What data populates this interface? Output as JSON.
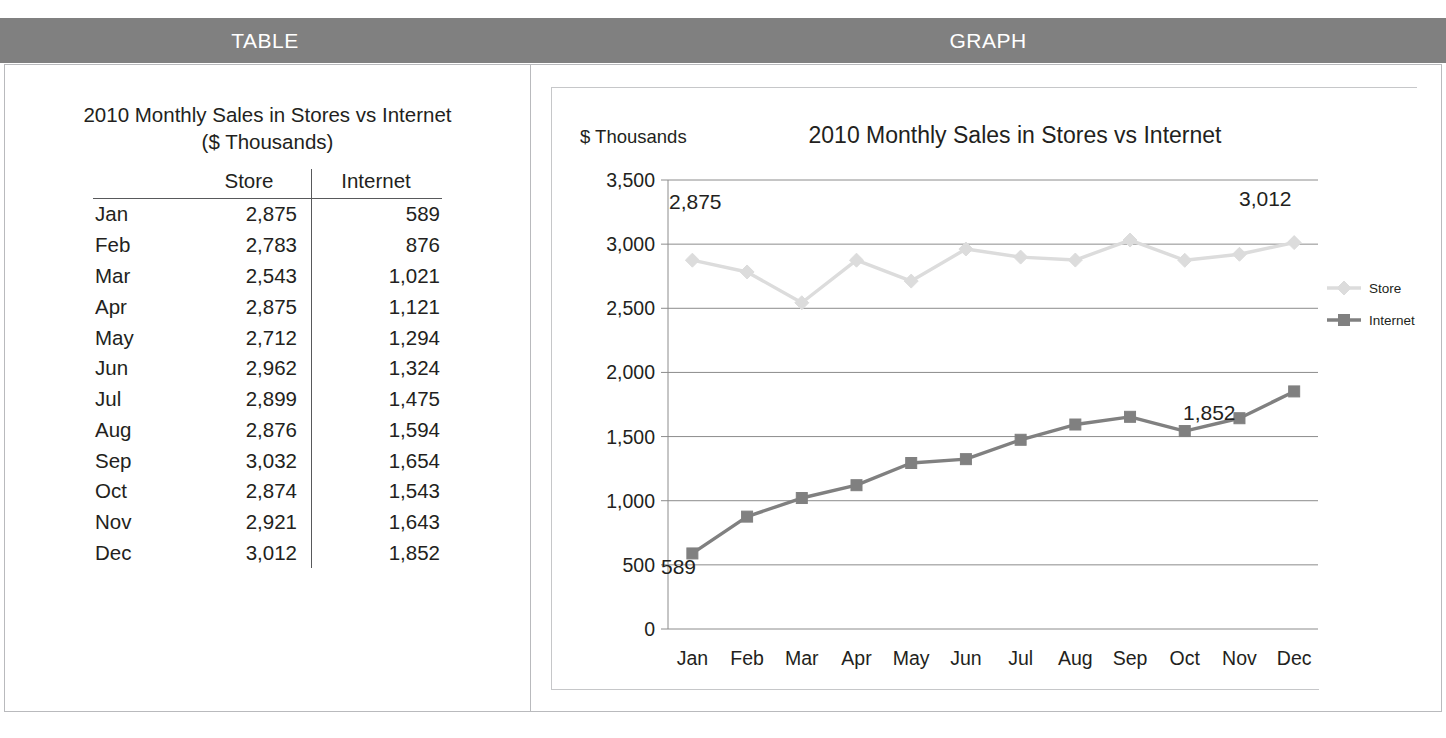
{
  "header": {
    "table_label": "TABLE",
    "graph_label": "GRAPH",
    "band_color": "#808080"
  },
  "table_panel": {
    "title_line1": "2010 Monthly Sales in Stores vs Internet",
    "title_line2": "($ Thousands)",
    "columns": [
      "",
      "Store",
      "Internet"
    ],
    "rows": [
      {
        "month": "Jan",
        "store": "2,875",
        "internet": "589"
      },
      {
        "month": "Feb",
        "store": "2,783",
        "internet": "876"
      },
      {
        "month": "Mar",
        "store": "2,543",
        "internet": "1,021"
      },
      {
        "month": "Apr",
        "store": "2,875",
        "internet": "1,121"
      },
      {
        "month": "May",
        "store": "2,712",
        "internet": "1,294"
      },
      {
        "month": "Jun",
        "store": "2,962",
        "internet": "1,324"
      },
      {
        "month": "Jul",
        "store": "2,899",
        "internet": "1,475"
      },
      {
        "month": "Aug",
        "store": "2,876",
        "internet": "1,594"
      },
      {
        "month": "Sep",
        "store": "3,032",
        "internet": "1,654"
      },
      {
        "month": "Oct",
        "store": "2,874",
        "internet": "1,543"
      },
      {
        "month": "Nov",
        "store": "2,921",
        "internet": "1,643"
      },
      {
        "month": "Dec",
        "store": "3,012",
        "internet": "1,852"
      }
    ]
  },
  "graph_panel": {
    "axis_unit_label": "$ Thousands",
    "annotations": [
      {
        "text": "2,875",
        "x": 668,
        "y": 208
      },
      {
        "text": "3,012",
        "x": 1238,
        "y": 205
      },
      {
        "text": "1,852",
        "x": 1182,
        "y": 419
      },
      {
        "text": "589",
        "x": 660,
        "y": 573
      }
    ],
    "legend": [
      {
        "label": "Store",
        "color": "#dcdcdc",
        "marker": "diamond"
      },
      {
        "label": "Internet",
        "color": "#808080",
        "marker": "square"
      }
    ]
  },
  "chart_data": {
    "type": "line",
    "title": "2010 Monthly Sales in Stores vs Internet",
    "xlabel": "",
    "ylabel": "$ Thousands",
    "ylim": [
      0,
      3500
    ],
    "ytick_labels": [
      "3,500",
      "3,000",
      "2,500",
      "2,000",
      "1,500",
      "1,000",
      "500",
      "0"
    ],
    "yticks": [
      3500,
      3000,
      2500,
      2000,
      1500,
      1000,
      500,
      0
    ],
    "grid": true,
    "legend_position": "right",
    "categories": [
      "Jan",
      "Feb",
      "Mar",
      "Apr",
      "May",
      "Jun",
      "Jul",
      "Aug",
      "Sep",
      "Oct",
      "Nov",
      "Dec"
    ],
    "series": [
      {
        "name": "Store",
        "color": "#dcdcdc",
        "marker": "diamond",
        "values": [
          2875,
          2783,
          2543,
          2875,
          2712,
          2962,
          2899,
          2876,
          3032,
          2874,
          2921,
          3012
        ]
      },
      {
        "name": "Internet",
        "color": "#808080",
        "marker": "square",
        "values": [
          589,
          876,
          1021,
          1121,
          1294,
          1324,
          1475,
          1594,
          1654,
          1543,
          1643,
          1852
        ]
      }
    ],
    "data_labels": [
      "2,875",
      "3,012",
      "1,852",
      "589"
    ]
  }
}
